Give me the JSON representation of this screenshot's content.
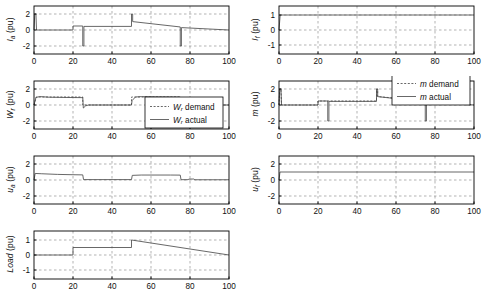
{
  "figure": {
    "background": "#ffffff",
    "axis_color": "#000000",
    "grid_color": "#808080",
    "line_color": "#4d4d4d",
    "width": 489,
    "height": 304
  },
  "chart_data": [
    {
      "id": "ia",
      "type": "line",
      "title": "",
      "ylabel": "I_a (pu)",
      "ylabel_parts": {
        "sym": "I",
        "sub": "a",
        "unit": " (pu)"
      },
      "xlabel": "",
      "xlim": [
        0,
        100
      ],
      "ylim": [
        -3,
        3
      ],
      "xticks": [
        0,
        20,
        40,
        60,
        80,
        100
      ],
      "yticks": [
        -2,
        0,
        2
      ],
      "xticklabels": [
        "0",
        "20",
        "40",
        "60",
        "80",
        "100"
      ],
      "yticklabels": [
        "-2",
        "0",
        "2"
      ],
      "grid": true,
      "legend": null,
      "series": [
        {
          "name": "I a",
          "style": "solid",
          "points": [
            [
              0,
              0
            ],
            [
              0.4,
              2.0
            ],
            [
              1.0,
              2.0
            ],
            [
              1.3,
              0.0
            ],
            [
              20,
              0.0
            ],
            [
              20,
              0.5
            ],
            [
              25,
              0.5
            ],
            [
              25,
              -2.0
            ],
            [
              25.6,
              -2.0
            ],
            [
              25.6,
              0.45
            ],
            [
              50,
              0.45
            ],
            [
              50,
              2.0
            ],
            [
              50.6,
              2.0
            ],
            [
              50.6,
              1.05
            ],
            [
              75,
              0.38
            ],
            [
              75,
              -2.0
            ],
            [
              75.6,
              -2.0
            ],
            [
              75.6,
              0.3
            ],
            [
              100,
              0.0
            ]
          ]
        }
      ]
    },
    {
      "id": "if",
      "type": "line",
      "title": "",
      "ylabel": "I_f (pu)",
      "ylabel_parts": {
        "sym": "I",
        "sub": "f",
        "unit": " (pu)"
      },
      "xlabel": "",
      "xlim": [
        0,
        100
      ],
      "ylim": [
        -1.6,
        1.6
      ],
      "xticks": [
        0,
        20,
        40,
        60,
        80,
        100
      ],
      "yticks": [
        -1,
        0,
        1
      ],
      "xticklabels": [
        "0",
        "20",
        "40",
        "60",
        "80",
        "100"
      ],
      "yticklabels": [
        "-1",
        "0",
        "1"
      ],
      "grid": true,
      "legend": null,
      "series": [
        {
          "name": "I f",
          "style": "solid",
          "points": [
            [
              0,
              0
            ],
            [
              0.6,
              1.0
            ],
            [
              100,
              1.0
            ]
          ]
        }
      ]
    },
    {
      "id": "wr",
      "type": "line",
      "title": "",
      "ylabel": "W_r (pu)",
      "ylabel_parts": {
        "sym": "W",
        "sub": "r",
        "unit": " (pu)"
      },
      "xlabel": "",
      "xlim": [
        0,
        100
      ],
      "ylim": [
        -3,
        3
      ],
      "xticks": [
        0,
        20,
        40,
        60,
        80,
        100
      ],
      "yticks": [
        -2,
        0,
        2
      ],
      "xticklabels": [
        "0",
        "20",
        "40",
        "60",
        "80",
        "100"
      ],
      "yticklabels": [
        "-2",
        "0",
        "2"
      ],
      "grid": true,
      "legend": {
        "position": "lower-right",
        "entries": [
          {
            "label": "W_r demand",
            "sym": "W",
            "sub": "r",
            "rest": " demand",
            "style": "dashed"
          },
          {
            "label": "W_r actual",
            "sym": "W",
            "sub": "r",
            "rest": " actual",
            "style": "solid"
          }
        ]
      },
      "series": [
        {
          "name": "W r demand",
          "style": "dashed",
          "points": [
            [
              0,
              0
            ],
            [
              1.2,
              1.0
            ],
            [
              25,
              1.0
            ],
            [
              25,
              0
            ],
            [
              50,
              0
            ],
            [
              50,
              1.0
            ],
            [
              75,
              1.0
            ],
            [
              75,
              0
            ],
            [
              100,
              0
            ]
          ]
        },
        {
          "name": "W r actual",
          "style": "solid",
          "points": [
            [
              0,
              0
            ],
            [
              1.0,
              0.95
            ],
            [
              3,
              1.05
            ],
            [
              8,
              0.97
            ],
            [
              20,
              0.93
            ],
            [
              25,
              0.92
            ],
            [
              25.3,
              -0.38
            ],
            [
              26.5,
              -0.1
            ],
            [
              28,
              0.0
            ],
            [
              50,
              0.0
            ],
            [
              50.3,
              0.55
            ],
            [
              52,
              1.0
            ],
            [
              55,
              1.05
            ],
            [
              60,
              1.0
            ],
            [
              75,
              0.97
            ],
            [
              75.3,
              -0.38
            ],
            [
              76.5,
              -0.12
            ],
            [
              78,
              0.0
            ],
            [
              100,
              0.0
            ]
          ]
        }
      ]
    },
    {
      "id": "m",
      "type": "line",
      "title": "",
      "ylabel": "m (pu)",
      "ylabel_parts": {
        "sym": "m",
        "sub": "",
        "unit": " (pu)"
      },
      "xlabel": "",
      "xlim": [
        0,
        100
      ],
      "ylim": [
        -3,
        3
      ],
      "xticks": [
        0,
        20,
        40,
        60,
        80,
        100
      ],
      "yticks": [
        -2,
        0,
        2
      ],
      "xticklabels": [
        "0",
        "20",
        "40",
        "60",
        "80",
        "100"
      ],
      "yticklabels": [
        "-2",
        "0",
        "2"
      ],
      "grid": true,
      "legend": {
        "position": "upper-right",
        "entries": [
          {
            "label": "m demand",
            "sym": "m",
            "sub": "",
            "rest": " demand",
            "style": "dashed"
          },
          {
            "label": "m actual",
            "sym": "m",
            "sub": "",
            "rest": " actual",
            "style": "solid"
          }
        ]
      },
      "series": [
        {
          "name": "m demand",
          "style": "dashed",
          "points": [
            [
              0,
              0
            ],
            [
              0.4,
              2.0
            ],
            [
              1.0,
              2.0
            ],
            [
              1.3,
              0.0
            ],
            [
              20,
              0.0
            ],
            [
              20,
              0.5
            ],
            [
              50,
              0.5
            ],
            [
              50,
              2.0
            ],
            [
              50.6,
              2.0
            ],
            [
              50.6,
              1.05
            ],
            [
              100,
              0.0
            ]
          ]
        },
        {
          "name": "m actual",
          "style": "solid",
          "points": [
            [
              0,
              0
            ],
            [
              0.4,
              2.0
            ],
            [
              1.0,
              2.0
            ],
            [
              1.3,
              0.0
            ],
            [
              20,
              0.0
            ],
            [
              20,
              0.5
            ],
            [
              25,
              0.5
            ],
            [
              25,
              -2.0
            ],
            [
              25.6,
              -2.0
            ],
            [
              25.6,
              0.45
            ],
            [
              50,
              0.45
            ],
            [
              50,
              2.0
            ],
            [
              50.6,
              2.0
            ],
            [
              50.6,
              1.05
            ],
            [
              75,
              0.38
            ],
            [
              75,
              -2.0
            ],
            [
              75.6,
              -2.0
            ],
            [
              75.6,
              0.3
            ],
            [
              100,
              0.0
            ]
          ]
        }
      ]
    },
    {
      "id": "ua",
      "type": "line",
      "title": "",
      "ylabel": "u_a (pu)",
      "ylabel_parts": {
        "sym": "u",
        "sub": "a",
        "unit": " (pu)"
      },
      "xlabel": "",
      "xlim": [
        0,
        100
      ],
      "ylim": [
        -3,
        3
      ],
      "xticks": [
        0,
        20,
        40,
        60,
        80,
        100
      ],
      "yticks": [
        -2,
        0,
        2
      ],
      "xticklabels": [
        "0",
        "20",
        "40",
        "60",
        "80",
        "100"
      ],
      "yticklabels": [
        "-2",
        "0",
        "2"
      ],
      "grid": true,
      "legend": null,
      "series": [
        {
          "name": "u a",
          "style": "solid",
          "points": [
            [
              0,
              0
            ],
            [
              0.6,
              0.82
            ],
            [
              4,
              0.78
            ],
            [
              12,
              0.7
            ],
            [
              20,
              0.66
            ],
            [
              25,
              0.64
            ],
            [
              25.4,
              0.05
            ],
            [
              50,
              0.05
            ],
            [
              50.4,
              0.58
            ],
            [
              55,
              0.62
            ],
            [
              70,
              0.62
            ],
            [
              75,
              0.61
            ],
            [
              75.4,
              0.04
            ],
            [
              79,
              0.04
            ],
            [
              79.5,
              0.12
            ],
            [
              82,
              0.12
            ],
            [
              82.5,
              0.03
            ],
            [
              100,
              0.03
            ]
          ]
        }
      ]
    },
    {
      "id": "uf",
      "type": "line",
      "title": "",
      "ylabel": "u_f (pu)",
      "ylabel_parts": {
        "sym": "u",
        "sub": "f",
        "unit": " (pu)"
      },
      "xlabel": "",
      "xlim": [
        0,
        100
      ],
      "ylim": [
        -3,
        3
      ],
      "xticks": [
        0,
        20,
        40,
        60,
        80,
        100
      ],
      "yticks": [
        -2,
        0,
        2
      ],
      "xticklabels": [
        "0",
        "20",
        "40",
        "60",
        "80",
        "100"
      ],
      "yticklabels": [
        "-2",
        "0",
        "2"
      ],
      "grid": true,
      "legend": null,
      "series": [
        {
          "name": "u f",
          "style": "solid",
          "points": [
            [
              0,
              0
            ],
            [
              0.5,
              1.0
            ],
            [
              100,
              1.0
            ]
          ]
        }
      ]
    },
    {
      "id": "load",
      "type": "line",
      "title": "",
      "ylabel": "Load (pu)",
      "ylabel_parts": {
        "sym": "Load",
        "sub": "",
        "unit": " (pu)"
      },
      "xlabel": "",
      "xlim": [
        0,
        100
      ],
      "ylim": [
        -1.6,
        1.6
      ],
      "xticks": [
        0,
        20,
        40,
        60,
        80,
        100
      ],
      "yticks": [
        -1,
        0,
        1
      ],
      "xticklabels": [
        "0",
        "20",
        "40",
        "60",
        "80",
        "100"
      ],
      "yticklabels": [
        "-1",
        "0",
        "1"
      ],
      "grid": true,
      "legend": null,
      "series": [
        {
          "name": "Load",
          "style": "solid",
          "points": [
            [
              0,
              0
            ],
            [
              20,
              0
            ],
            [
              20,
              0.5
            ],
            [
              50,
              0.5
            ],
            [
              50,
              1.0
            ],
            [
              100,
              0.0
            ]
          ]
        }
      ]
    }
  ]
}
